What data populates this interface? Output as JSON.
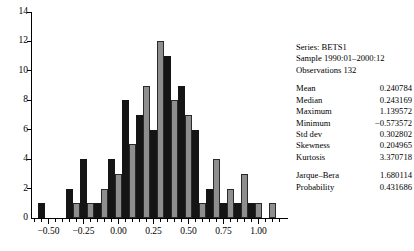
{
  "header": {
    "series": "Series: BETS1",
    "sample": "Sample 1990:01–2000:12",
    "observations": "Observations 132"
  },
  "stats": [
    {
      "key": "Mean",
      "value": "0.240784"
    },
    {
      "key": "Median",
      "value": "0.243169"
    },
    {
      "key": "Maximum",
      "value": "1.139572"
    },
    {
      "key": "Minimum",
      "value": "−0.573572"
    },
    {
      "key": "Std dev",
      "value": "0.302802"
    },
    {
      "key": "Skewness",
      "value": "0.204965"
    },
    {
      "key": "Kurtosis",
      "value": "3.370718"
    }
  ],
  "tests": [
    {
      "key": "Jarque–Bera",
      "value": "1.680114"
    },
    {
      "key": "Probability",
      "value": "0.431686"
    }
  ],
  "colors": {
    "bar_dark": "#151515",
    "bar_light": "#8e8e8e",
    "axis": "#000000",
    "background": "#ffffff"
  },
  "chart_data": {
    "type": "bar",
    "title": "",
    "xlabel": "",
    "ylabel": "",
    "ylim": [
      0,
      14
    ],
    "yticks": [
      0,
      2,
      4,
      6,
      8,
      10,
      12,
      14
    ],
    "ytick_labels": [
      "0",
      "2",
      "4",
      "6",
      "8",
      "10",
      "12",
      "14"
    ],
    "xlim": [
      -0.625,
      1.175
    ],
    "xticks": [
      -0.5,
      -0.25,
      0.0,
      0.25,
      0.5,
      0.75,
      1.0
    ],
    "xtick_labels": [
      "−0.50",
      "−0.25",
      "0.00",
      "0.25",
      "0.50",
      "0.75",
      "1.00"
    ],
    "grid": false,
    "legend": false,
    "bin_width": 0.05,
    "bin_centers": [
      -0.55,
      -0.5,
      -0.45,
      -0.4,
      -0.35,
      -0.3,
      -0.25,
      -0.2,
      -0.15,
      -0.1,
      -0.05,
      0.0,
      0.05,
      0.1,
      0.15,
      0.2,
      0.25,
      0.3,
      0.35,
      0.4,
      0.45,
      0.5,
      0.55,
      0.6,
      0.65,
      0.7,
      0.75,
      0.8,
      0.85,
      0.9,
      0.95,
      1.0,
      1.05,
      1.1
    ],
    "values": [
      1,
      0,
      0,
      0,
      2,
      1,
      4,
      1,
      1,
      2,
      4,
      3,
      8,
      5,
      7,
      9,
      6,
      12,
      11,
      8,
      9,
      7,
      6,
      1,
      2,
      4,
      1,
      2,
      1,
      3,
      1,
      1,
      0,
      1,
      1
    ],
    "series": [
      {
        "name": "BETS1",
        "values": [
          1,
          0,
          0,
          0,
          2,
          1,
          4,
          1,
          1,
          2,
          4,
          3,
          8,
          5,
          7,
          9,
          6,
          12,
          11,
          8,
          9,
          7,
          6,
          1,
          2,
          4,
          1,
          2,
          1,
          3,
          1,
          1,
          0,
          1,
          1
        ]
      }
    ]
  }
}
